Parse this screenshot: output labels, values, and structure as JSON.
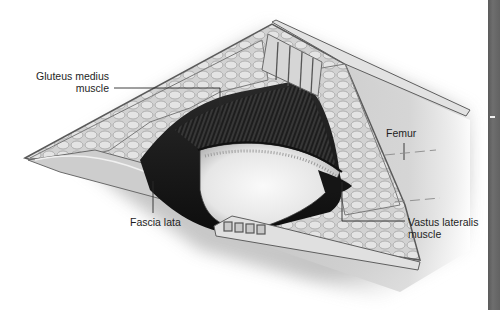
{
  "figure": {
    "style": "grayscale anatomical illustration",
    "labels": {
      "gluteus_medius": {
        "line1": "Gluteus medius",
        "line2": "muscle"
      },
      "femur": {
        "text": "Femur"
      },
      "fascia_lata": {
        "text": "Fascia lata"
      },
      "vastus_lateralis": {
        "line1": "Vastus lateralis",
        "line2": "muscle"
      }
    }
  },
  "colors": {
    "background": "#ffffff",
    "label_text": "#1e1e1e",
    "leader_line": "#2a2a2a",
    "side_strip": "#636363",
    "skin": "#d9d9d9",
    "fat_tissue": "#c8c8c8",
    "muscle_dark": "#1a1a1a",
    "bone": "#ececec"
  }
}
